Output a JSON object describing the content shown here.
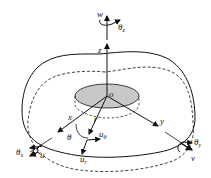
{
  "diagram": {
    "type": "plate coordinate system",
    "labels": {
      "w": "w",
      "theta_z": "θ",
      "theta_z_sub": "z",
      "z": "z",
      "o": "o",
      "x": "x",
      "y": "y",
      "r": "r",
      "theta": "θ",
      "u_theta": "u",
      "u_theta_sub": "θ",
      "u_r": "u",
      "u_r_sub": "r",
      "theta_x": "θ",
      "theta_x_sub": "x",
      "u": "u",
      "theta_y": "θ",
      "theta_y_sub": "y",
      "v": "v"
    },
    "colors": {
      "stroke": "#111111",
      "hub_fill": "#c8c8c8",
      "background": "#ffffff"
    }
  }
}
